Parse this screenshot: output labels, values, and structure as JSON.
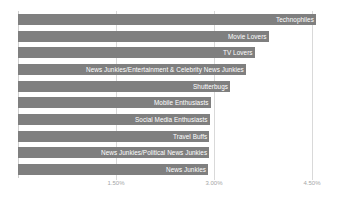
{
  "chart_data": {
    "type": "bar",
    "orientation": "horizontal",
    "title": "",
    "subtitle": "",
    "xlabel": "",
    "ylabel": "",
    "xlim": [
      0,
      4.75
    ],
    "grid": true,
    "legend": "none",
    "value_suffix": "%",
    "tick_labels": [
      "1.50%",
      "3.00%",
      "4.50%"
    ],
    "tick_values": [
      1.5,
      3.0,
      4.5
    ],
    "categories": [
      "Technophiles",
      "Movie Lovers",
      "TV Lovers",
      "News Junkies/Entertainment & Celebrity News Junkies",
      "Shutterbugs",
      "Mobile Enthusiasts",
      "Social Media Enthusiasts",
      "Travel Buffs",
      "News Junkies/Political News Junkies",
      "News Junkies"
    ],
    "values": [
      4.57,
      3.84,
      3.63,
      3.49,
      3.25,
      2.96,
      2.94,
      2.93,
      2.93,
      2.91
    ],
    "bar_color": "#7f7f7f",
    "label_text_color": "#ffffff",
    "gridline_color": "#d9d9d9",
    "tick_text_color": "#a6a6a6"
  }
}
